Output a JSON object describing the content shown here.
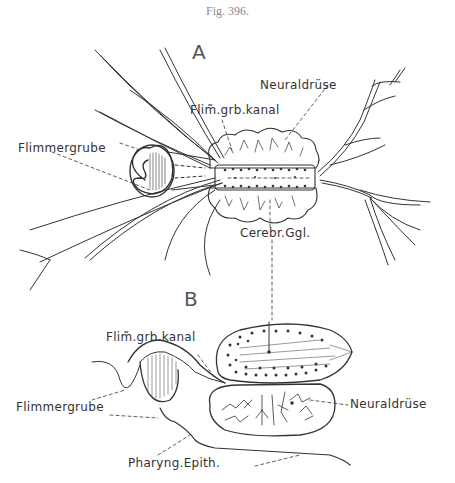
{
  "figure": {
    "caption": "Fig. 396.",
    "panels": [
      {
        "letter": "A",
        "labels": {
          "neuraldruse": "Neuraldrüse",
          "flim_grb_kanal": "Flim̃.grb.kanal",
          "flimmergrube": "Flimmergrube",
          "cerebr_ggl": "Cerebr.Ggl."
        }
      },
      {
        "letter": "B",
        "labels": {
          "flim_grb_kanal": "Flim̃.grb.kanal",
          "flimmergrube": "Flimmergrube",
          "neuraldruse": "Neuraldrüse",
          "pharyng_epith": "Pharyng.Epith."
        }
      }
    ]
  },
  "colors": {
    "ink": "#333333",
    "caption": "#8a8a8a",
    "background": "#ffffff"
  }
}
